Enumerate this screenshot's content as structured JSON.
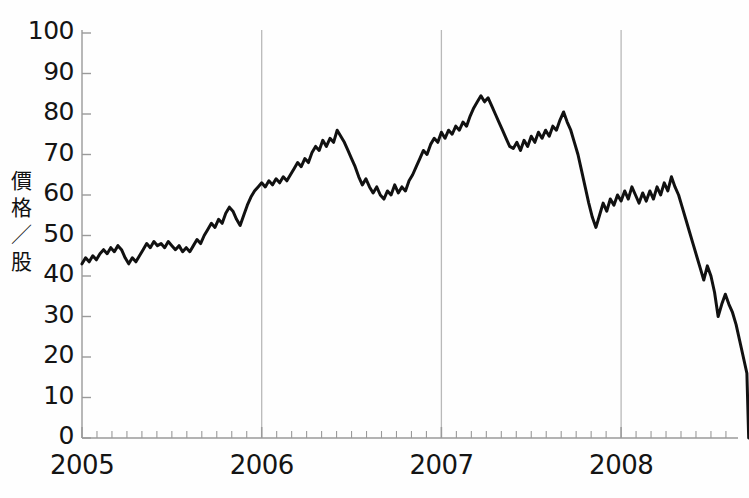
{
  "chart_data": {
    "type": "line",
    "title": "",
    "subtitle": "",
    "xlabel": "",
    "ylabel": "價格／股",
    "ylabel_chars": [
      "價",
      "格",
      "／",
      "股"
    ],
    "ylim": [
      0,
      100
    ],
    "xlim": [
      2005.0,
      2008.75
    ],
    "yticks": [
      0,
      10,
      20,
      30,
      40,
      50,
      60,
      70,
      80,
      90,
      100
    ],
    "ytick_labels": [
      "0",
      "10",
      "20",
      "30",
      "40",
      "50",
      "60",
      "70",
      "80",
      "90",
      "100"
    ],
    "xticks": [
      2005,
      2006,
      2007,
      2008
    ],
    "xtick_labels": [
      "2005",
      "2006",
      "2007",
      "2008"
    ],
    "minor_xticks_per_year": 12,
    "grid": "vertical-year-lines-only",
    "legend": "none",
    "line_color": "#111111",
    "line_width": 3,
    "gridline_color": "#b9b9b9",
    "axis_color": "#8a8a8a",
    "annotations": [],
    "series": [
      {
        "name": "價格／股",
        "x": [
          2005.0,
          2005.02,
          2005.04,
          2005.06,
          2005.08,
          2005.1,
          2005.12,
          2005.14,
          2005.16,
          2005.18,
          2005.2,
          2005.22,
          2005.24,
          2005.26,
          2005.28,
          2005.3,
          2005.32,
          2005.34,
          2005.36,
          2005.38,
          2005.4,
          2005.42,
          2005.44,
          2005.46,
          2005.48,
          2005.5,
          2005.52,
          2005.54,
          2005.56,
          2005.58,
          2005.6,
          2005.62,
          2005.64,
          2005.66,
          2005.68,
          2005.7,
          2005.72,
          2005.74,
          2005.76,
          2005.78,
          2005.8,
          2005.82,
          2005.84,
          2005.86,
          2005.88,
          2005.9,
          2005.92,
          2005.94,
          2005.96,
          2005.98,
          2006.0,
          2006.02,
          2006.04,
          2006.06,
          2006.08,
          2006.1,
          2006.12,
          2006.14,
          2006.16,
          2006.18,
          2006.2,
          2006.22,
          2006.24,
          2006.26,
          2006.28,
          2006.3,
          2006.32,
          2006.34,
          2006.36,
          2006.38,
          2006.4,
          2006.42,
          2006.44,
          2006.46,
          2006.48,
          2006.5,
          2006.52,
          2006.54,
          2006.56,
          2006.58,
          2006.6,
          2006.62,
          2006.64,
          2006.66,
          2006.68,
          2006.7,
          2006.72,
          2006.74,
          2006.76,
          2006.78,
          2006.8,
          2006.82,
          2006.84,
          2006.86,
          2006.88,
          2006.9,
          2006.92,
          2006.94,
          2006.96,
          2006.98,
          2007.0,
          2007.02,
          2007.04,
          2007.06,
          2007.08,
          2007.1,
          2007.12,
          2007.14,
          2007.16,
          2007.18,
          2007.2,
          2007.22,
          2007.24,
          2007.26,
          2007.28,
          2007.3,
          2007.32,
          2007.34,
          2007.36,
          2007.38,
          2007.4,
          2007.42,
          2007.44,
          2007.46,
          2007.48,
          2007.5,
          2007.52,
          2007.54,
          2007.56,
          2007.58,
          2007.6,
          2007.62,
          2007.64,
          2007.66,
          2007.68,
          2007.7,
          2007.72,
          2007.74,
          2007.76,
          2007.78,
          2007.8,
          2007.82,
          2007.84,
          2007.86,
          2007.88,
          2007.9,
          2007.92,
          2007.94,
          2007.96,
          2007.98,
          2008.0,
          2008.02,
          2008.04,
          2008.06,
          2008.08,
          2008.1,
          2008.12,
          2008.14,
          2008.16,
          2008.18,
          2008.2,
          2008.22,
          2008.24,
          2008.26,
          2008.28,
          2008.3,
          2008.32,
          2008.34,
          2008.36,
          2008.38,
          2008.4,
          2008.42,
          2008.44,
          2008.46,
          2008.48,
          2008.5,
          2008.52,
          2008.54,
          2008.56,
          2008.58,
          2008.6,
          2008.62,
          2008.64,
          2008.66,
          2008.68,
          2008.7,
          2008.71
        ],
        "values": [
          43.0,
          44.5,
          43.5,
          45.0,
          44.0,
          45.5,
          46.5,
          45.5,
          47.0,
          46.0,
          47.5,
          46.5,
          44.5,
          43.0,
          44.5,
          43.5,
          45.0,
          46.5,
          48.0,
          47.0,
          48.5,
          47.5,
          48.0,
          47.0,
          48.5,
          47.5,
          46.5,
          47.5,
          46.0,
          47.0,
          46.0,
          47.5,
          49.0,
          48.0,
          50.0,
          51.5,
          53.0,
          52.0,
          54.0,
          53.0,
          55.5,
          57.0,
          56.0,
          54.0,
          52.5,
          55.0,
          57.5,
          59.5,
          61.0,
          62.0,
          63.0,
          62.0,
          63.5,
          62.5,
          64.0,
          63.0,
          64.5,
          63.5,
          65.0,
          66.5,
          68.0,
          67.0,
          69.0,
          68.0,
          70.5,
          72.0,
          71.0,
          73.5,
          72.0,
          74.0,
          73.0,
          76.0,
          74.5,
          73.0,
          71.0,
          69.0,
          67.0,
          64.5,
          62.5,
          64.0,
          62.0,
          60.5,
          62.0,
          60.0,
          59.0,
          61.0,
          60.0,
          62.5,
          60.5,
          62.0,
          61.0,
          63.5,
          65.0,
          67.0,
          69.0,
          71.0,
          70.0,
          72.5,
          74.0,
          73.0,
          75.5,
          74.0,
          76.0,
          75.0,
          77.0,
          76.0,
          78.0,
          77.0,
          79.5,
          81.5,
          83.0,
          84.5,
          83.0,
          84.0,
          82.0,
          80.0,
          78.0,
          76.0,
          74.0,
          72.0,
          71.5,
          73.0,
          71.0,
          73.5,
          72.0,
          74.5,
          73.0,
          75.5,
          74.0,
          76.0,
          74.5,
          77.0,
          76.0,
          78.5,
          80.5,
          78.0,
          76.0,
          73.0,
          70.0,
          66.0,
          62.0,
          58.0,
          54.5,
          52.0,
          55.0,
          58.0,
          56.0,
          59.0,
          57.5,
          60.0,
          58.5,
          61.0,
          59.0,
          62.0,
          60.0,
          58.0,
          60.5,
          58.5,
          61.0,
          59.0,
          62.0,
          60.0,
          63.0,
          61.0,
          64.5,
          62.0,
          60.0,
          57.0,
          54.0,
          51.0,
          48.0,
          45.0,
          42.0,
          39.0,
          42.5,
          40.0,
          36.0,
          30.0,
          33.0,
          35.5,
          33.0,
          31.0,
          28.0,
          24.0,
          20.0,
          16.0,
          0.0
        ]
      }
    ]
  },
  "axis": {
    "y_label_stack": [
      "價",
      "格",
      "／",
      "股"
    ]
  }
}
